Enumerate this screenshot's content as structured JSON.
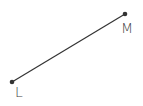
{
  "diagram": {
    "type": "line-segment",
    "points": [
      {
        "label": "L",
        "x": 12,
        "y": 82,
        "label_x": 15,
        "label_y": 97
      },
      {
        "label": "M",
        "x": 125,
        "y": 14,
        "label_x": 121,
        "label_y": 33
      }
    ],
    "segment": {
      "from": "L",
      "to": "M",
      "color": "#333333"
    }
  }
}
